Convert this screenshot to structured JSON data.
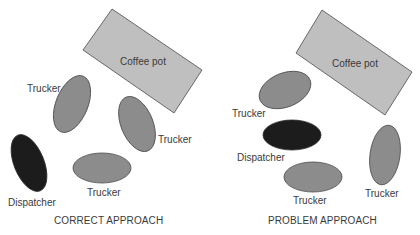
{
  "colors": {
    "background": "#ffffff",
    "coffee_pot_fill": "#bfbfbf",
    "trucker_fill": "#8c8c8c",
    "dispatcher_fill": "#1c1c1c",
    "outline": "#4a4a4a",
    "text": "#3a3a3a"
  },
  "panels": [
    {
      "caption": "CORRECT APPROACH",
      "coffee_pot": {
        "label": "Coffee pot"
      },
      "truckers": [
        {
          "label": "Trucker"
        },
        {
          "label": "Trucker"
        },
        {
          "label": "Trucker"
        }
      ],
      "dispatcher": {
        "label": "Dispatcher"
      }
    },
    {
      "caption": "PROBLEM APPROACH",
      "coffee_pot": {
        "label": "Coffee pot"
      },
      "truckers": [
        {
          "label": "Trucker"
        },
        {
          "label": "Trucker"
        },
        {
          "label": "Trucker"
        }
      ],
      "dispatcher": {
        "label": "Dispatcher"
      }
    }
  ]
}
